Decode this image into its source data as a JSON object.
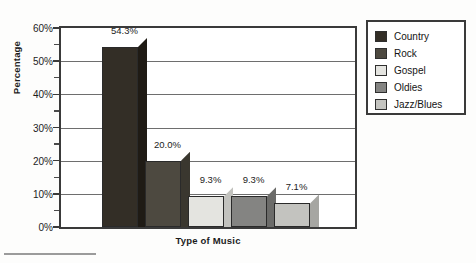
{
  "chart_data": {
    "type": "bar",
    "title": "",
    "xlabel": "Type of Music",
    "ylabel": "Percentage",
    "categories": [
      "Country",
      "Rock",
      "Gospel",
      "Oldies",
      "Jazz/Blues"
    ],
    "values": [
      54.3,
      20.0,
      9.3,
      9.3,
      7.1
    ],
    "data_labels": [
      "54.3%",
      "20.0%",
      "9.3%",
      "9.3%",
      "7.1%"
    ],
    "ylim": [
      0,
      60
    ],
    "y_tick_labels": [
      "0%",
      "10%",
      "20%",
      "30%",
      "40%",
      "50%",
      "60%"
    ],
    "y_tick_values": [
      0,
      10,
      20,
      30,
      40,
      50,
      60
    ],
    "y_minor_tick_values": [
      5,
      15,
      25,
      35,
      45,
      55
    ],
    "grid": "horizontal",
    "legend_position": "right",
    "legend": [
      {
        "label": "Country",
        "color": "#332e26"
      },
      {
        "label": "Rock",
        "color": "#4d4940"
      },
      {
        "label": "Gospel",
        "color": "#e4e4e0"
      },
      {
        "label": "Oldies",
        "color": "#848482"
      },
      {
        "label": "Jazz/Blues",
        "color": "#c3c3bf"
      }
    ],
    "series_colors": [
      "#332e26",
      "#4d4940",
      "#e4e4e0",
      "#848482",
      "#c3c3bf"
    ],
    "side_colors": [
      "#1f1b15",
      "#3a372f",
      "#c2c2be",
      "#6b6b69",
      "#a6a6a2"
    ],
    "style": "3d-bar"
  }
}
